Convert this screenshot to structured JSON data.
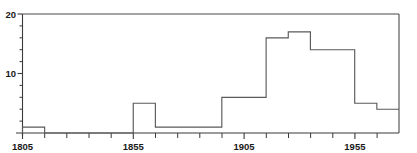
{
  "chart_data": {
    "type": "bar",
    "title": "",
    "subtitle": "",
    "xlabel": "",
    "ylabel": "",
    "style": "step-histogram",
    "grid": false,
    "legend": false,
    "legend_position": "none",
    "xlim": [
      1805,
      1975
    ],
    "ylim": [
      0,
      20
    ],
    "bin_width": 10,
    "x_major_ticks": [
      1805,
      1855,
      1905,
      1955
    ],
    "x_major_tick_labels": [
      "1805",
      "1855",
      "1905",
      "1955"
    ],
    "x_minor_ticks": [
      1815,
      1825,
      1835,
      1845,
      1865,
      1875,
      1885,
      1895,
      1915,
      1925,
      1935,
      1945,
      1965
    ],
    "y_major_ticks": [
      10,
      20
    ],
    "y_major_tick_labels": [
      "10",
      "20"
    ],
    "y_minor_ticks": [
      2,
      4,
      6,
      8,
      12,
      14,
      16,
      18
    ],
    "categories": [
      "1805-1815",
      "1815-1825",
      "1825-1835",
      "1835-1845",
      "1845-1855",
      "1855-1865",
      "1865-1875",
      "1875-1885",
      "1885-1895",
      "1895-1905",
      "1905-1915",
      "1915-1925",
      "1925-1935",
      "1935-1945",
      "1945-1955",
      "1955-1965",
      "1965-1975"
    ],
    "bin_starts": [
      1805,
      1815,
      1825,
      1835,
      1845,
      1855,
      1865,
      1875,
      1885,
      1895,
      1905,
      1915,
      1925,
      1935,
      1945,
      1955,
      1965
    ],
    "values": [
      1,
      0,
      0,
      0,
      0,
      5,
      1,
      1,
      1,
      6,
      6,
      16,
      17,
      14,
      14,
      5,
      4
    ],
    "series": [
      {
        "name": "count",
        "values": [
          1,
          0,
          0,
          0,
          0,
          5,
          1,
          1,
          1,
          6,
          6,
          16,
          17,
          14,
          14,
          5,
          4
        ]
      }
    ],
    "colors": {
      "line": "#5a5a5a",
      "axis": "#3a3a3a",
      "text": "#1a1a1a",
      "background": "#ffffff"
    }
  },
  "axes": {
    "y_label_top": "20",
    "y_label_mid": "10",
    "x_label_1": "1805",
    "x_label_2": "1855",
    "x_label_3": "1905",
    "x_label_4": "1955"
  }
}
